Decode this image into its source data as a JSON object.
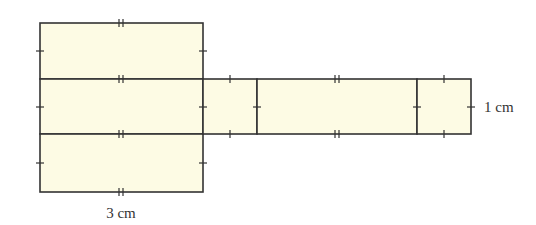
{
  "figure": {
    "type": "net of rectangular prism",
    "colors": {
      "fill": "#fdfbe4",
      "stroke": "#333333",
      "text": "#333333"
    },
    "labels": {
      "width_label": "3 cm",
      "height_label": "1 cm"
    },
    "faces": [
      {
        "name": "top-face",
        "x": 40,
        "y": 23,
        "w": 163,
        "h": 56
      },
      {
        "name": "front-face",
        "x": 40,
        "y": 79,
        "w": 163,
        "h": 55
      },
      {
        "name": "bottom-face",
        "x": 40,
        "y": 134,
        "w": 163,
        "h": 58
      },
      {
        "name": "side-face-1",
        "x": 203,
        "y": 79,
        "w": 54,
        "h": 55
      },
      {
        "name": "back-face",
        "x": 257,
        "y": 79,
        "w": 160,
        "h": 55
      },
      {
        "name": "side-face-2",
        "x": 417,
        "y": 79,
        "w": 54,
        "h": 55
      }
    ]
  }
}
